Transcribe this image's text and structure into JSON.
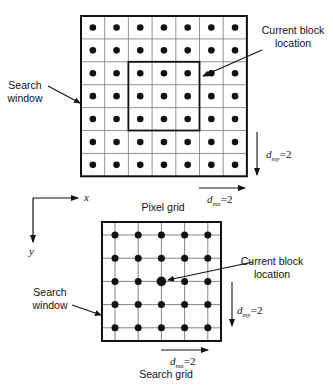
{
  "pixel_grid": {
    "caption": "Pixel grid",
    "rows": 7,
    "cols": 7,
    "origin": [
      81,
      16
    ],
    "cell_w": 23.7,
    "cell_h": 22.9,
    "current_block": {
      "row_start": 2,
      "col_start": 2,
      "rows": 3,
      "cols": 3
    },
    "labels": {
      "current_block_line1": "Current block",
      "current_block_line2": "location",
      "search_window_line1": "Search",
      "search_window_line2": "window",
      "dmy": {
        "base": "d",
        "sub": "my",
        "value": "=2"
      },
      "dmx": {
        "base": "d",
        "sub": "mx",
        "value": "=2"
      }
    }
  },
  "axes": {
    "x_label": "x",
    "y_label": "y"
  },
  "search_grid": {
    "caption": "Search grid",
    "points": 5,
    "origin": [
      102,
      222
    ],
    "size": 119,
    "first_point": [
      115,
      235
    ],
    "spacing": 23.2,
    "center_index": [
      2,
      2
    ],
    "labels": {
      "current_block_line1": "Current block",
      "current_block_line2": "location",
      "search_window_line1": "Search",
      "search_window_line2": "window",
      "dmy": {
        "base": "d",
        "sub": "my",
        "value": "=2"
      },
      "dmx": {
        "base": "d",
        "sub": "mx",
        "value": "=2"
      }
    }
  },
  "colors": {
    "ink": "#111111",
    "grid_line": "#777777",
    "background": "#ffffff"
  }
}
